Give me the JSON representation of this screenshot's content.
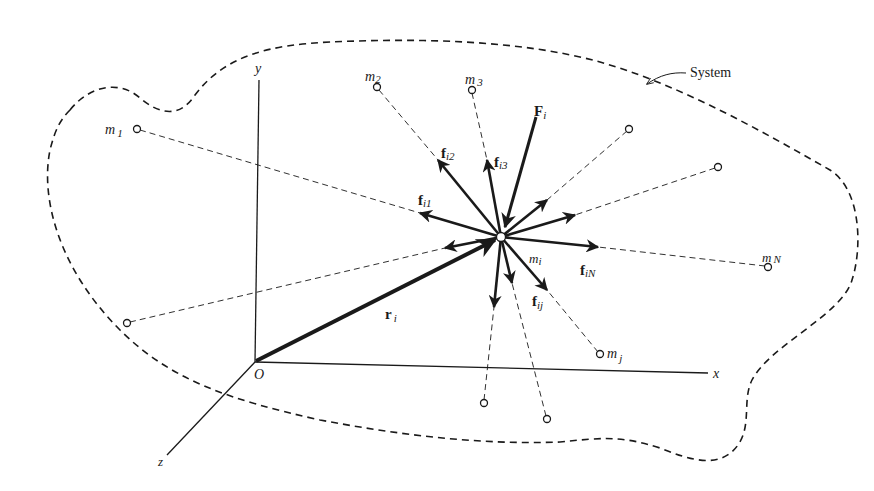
{
  "figure": {
    "colors": {
      "ink": "#1a1a1a",
      "background": "#ffffff"
    }
  },
  "labels": {
    "system": "System",
    "origin": "O",
    "axis_x": "x",
    "axis_y": "y",
    "axis_z": "z",
    "m1": {
      "base": "m",
      "sub": "1"
    },
    "m2": {
      "base": "m",
      "sub": "2"
    },
    "m3": {
      "base": "m",
      "sub": "3"
    },
    "mN": {
      "base": "m",
      "sub": "N"
    },
    "mj": {
      "base": "m",
      "sub": "j"
    },
    "mi": {
      "base": "m",
      "sub": "i"
    },
    "Fi": {
      "base": "F",
      "sub": "i"
    },
    "ri": {
      "base": "r",
      "sub": "i"
    },
    "fi1": {
      "base": "f",
      "sub": "i1"
    },
    "fi2": {
      "base": "f",
      "sub": "i2"
    },
    "fi3": {
      "base": "f",
      "sub": "i3"
    },
    "fiN": {
      "base": "f",
      "sub": "iN"
    },
    "fij": {
      "base": "f",
      "sub": "ij"
    }
  },
  "particles": [
    {
      "name": "m1",
      "x": 137,
      "y": 129
    },
    {
      "name": "m2",
      "x": 377,
      "y": 87
    },
    {
      "name": "m3",
      "x": 472,
      "y": 90
    },
    {
      "name": "unlabeled-top-right-1",
      "x": 629,
      "y": 129
    },
    {
      "name": "unlabeled-top-right-2",
      "x": 718,
      "y": 167
    },
    {
      "name": "mN",
      "x": 768,
      "y": 267
    },
    {
      "name": "mj",
      "x": 600,
      "y": 354
    },
    {
      "name": "unlabeled-bottom-1",
      "x": 484,
      "y": 403
    },
    {
      "name": "unlabeled-bottom-2",
      "x": 547,
      "y": 419
    },
    {
      "name": "unlabeled-left",
      "x": 127,
      "y": 323
    }
  ],
  "center_particle": {
    "name": "mi",
    "x": 501,
    "y": 237
  }
}
